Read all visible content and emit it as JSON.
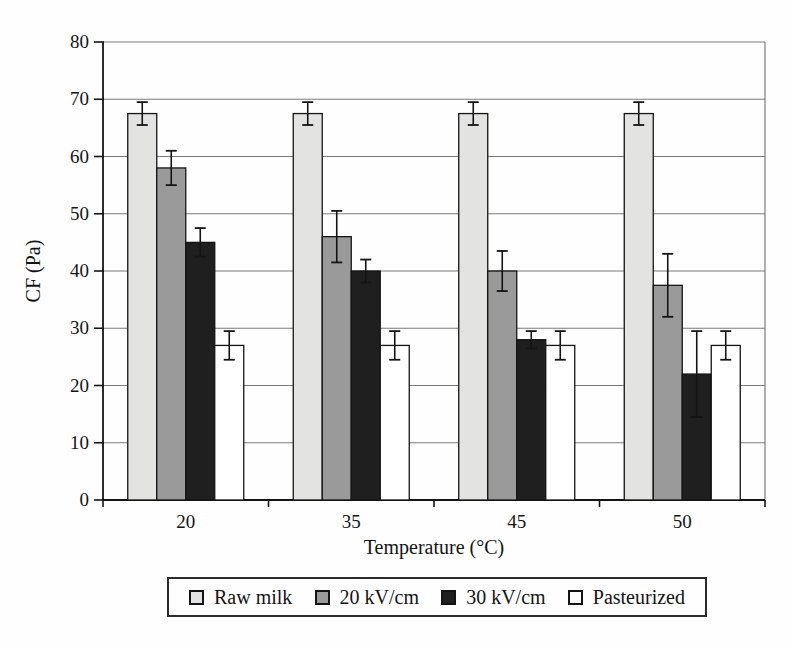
{
  "chart_data": {
    "type": "bar",
    "title": "",
    "xlabel": "Temperature (°C)",
    "ylabel": "CF (Pa)",
    "ylim": [
      0,
      80
    ],
    "ytick_step": 10,
    "grid": true,
    "legend_position": "bottom",
    "categories": [
      "20",
      "35",
      "45",
      "50"
    ],
    "series": [
      {
        "name": "Raw milk",
        "color": "#e3e3e1",
        "values": [
          67.5,
          67.5,
          67.5,
          67.5
        ],
        "errors": [
          2,
          2,
          2,
          2
        ]
      },
      {
        "name": "20 kV/cm",
        "color": "#9a9a9a",
        "values": [
          58,
          46,
          40,
          37.5
        ],
        "errors": [
          3,
          4.5,
          3.5,
          5.5
        ]
      },
      {
        "name": "30 kV/cm",
        "color": "#1f1f1f",
        "values": [
          45,
          40,
          28,
          22
        ],
        "errors": [
          2.5,
          2,
          1.5,
          7.5
        ]
      },
      {
        "name": "Pasteurized",
        "color": "#ffffff",
        "values": [
          27,
          27,
          27,
          27
        ],
        "errors": [
          2.5,
          2.5,
          2.5,
          2.5
        ]
      }
    ],
    "colors": {
      "axis": "#141414",
      "gridline": "#7a7a7a",
      "text": "#141414"
    }
  }
}
